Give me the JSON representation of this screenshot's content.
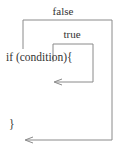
{
  "diagram": {
    "type": "control-flow",
    "code": {
      "if_line": "if (condition){",
      "close_brace": "}"
    },
    "branches": {
      "false_label": "false",
      "true_label": "true"
    },
    "colors": {
      "line": "#8a8a8a",
      "text": "#333333",
      "background": "#ffffff"
    }
  }
}
